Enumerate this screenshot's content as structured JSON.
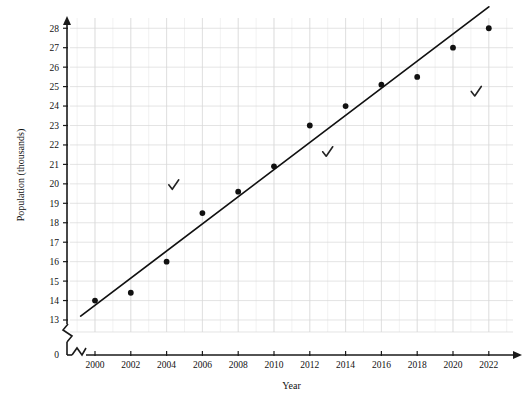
{
  "chart_data": {
    "type": "scatter",
    "title": "",
    "xlabel": "Year",
    "ylabel": "Population (thousands)",
    "x": [
      2000,
      2002,
      2004,
      2006,
      2008,
      2010,
      2012,
      2014,
      2016,
      2018,
      2020,
      2022
    ],
    "values": [
      14.0,
      14.4,
      16.0,
      18.5,
      19.6,
      20.9,
      23.0,
      24.0,
      25.1,
      25.5,
      27.0,
      28.0
    ],
    "series": [
      {
        "name": "Population",
        "values": [
          14.0,
          14.4,
          16.0,
          18.5,
          19.6,
          20.9,
          23.0,
          24.0,
          25.1,
          25.5,
          27.0,
          28.0
        ]
      }
    ],
    "trend_line": {
      "type": "line-of-best-fit",
      "x_start": 1999.2,
      "y_start": 13.2,
      "x_end": 2022.0,
      "y_end": 29.1
    },
    "xticks": [
      2000,
      2002,
      2004,
      2006,
      2008,
      2010,
      2012,
      2014,
      2016,
      2018,
      2020,
      2022
    ],
    "xticklabels": [
      "2000",
      "2002",
      "2004",
      "2006",
      "2008",
      "2010",
      "2012",
      "2014",
      "2016",
      "2018",
      "2020",
      "2022"
    ],
    "yticks": [
      13,
      14,
      15,
      16,
      17,
      18,
      19,
      20,
      21,
      22,
      23,
      24,
      25,
      26,
      27,
      28
    ],
    "yticklabels": [
      "13",
      "14",
      "15",
      "16",
      "17",
      "18",
      "19",
      "20",
      "21",
      "22",
      "23",
      "24",
      "25",
      "26",
      "27",
      "28"
    ],
    "y_origin_label": "0",
    "xlim": [
      1998.6,
      2023.0
    ],
    "ylim": [
      12.6,
      28.7
    ],
    "grid": true,
    "axis_break_y": true,
    "axis_break_x": true,
    "legend": "none",
    "annotations": [
      {
        "label": "check-mark",
        "symbol": "✓",
        "x": 2004.4,
        "y": 19.9
      },
      {
        "label": "check-mark",
        "symbol": "✓",
        "x": 2013.0,
        "y": 21.6
      },
      {
        "label": "check-mark",
        "symbol": "✓",
        "x": 2021.3,
        "y": 24.7
      }
    ],
    "colors": {
      "point": "#111111",
      "line": "#111111",
      "grid": "#d9d9d9",
      "axis": "#1a1a1a",
      "background": "#ffffff"
    }
  }
}
